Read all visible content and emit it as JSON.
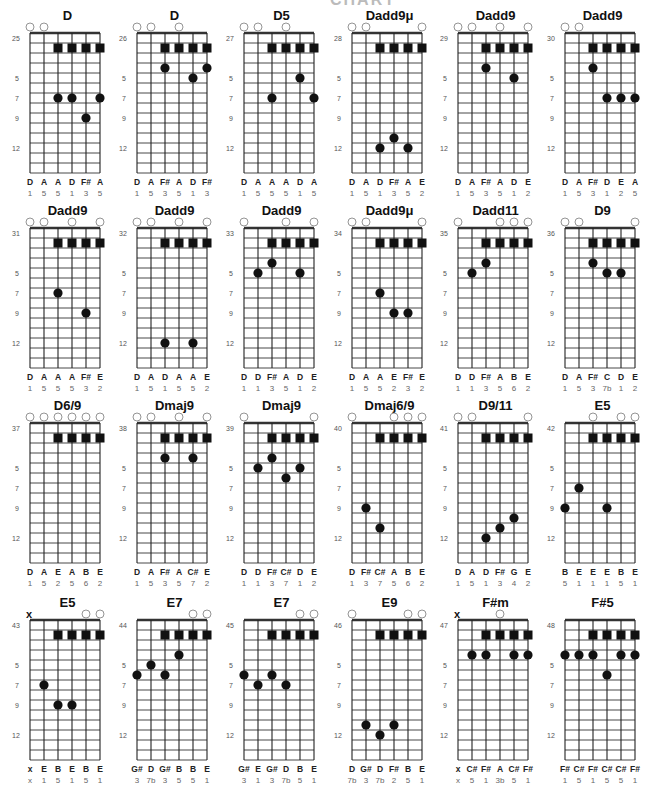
{
  "page": {
    "header_partial": "CHART"
  },
  "colors": {
    "ink": "#111111",
    "grid": "#222222",
    "open_circle": "#888888",
    "label_gray": "#555555"
  },
  "legend": {
    "fret_markers": [
      "5",
      "7",
      "9",
      "12"
    ],
    "open_string_symbol": "circle",
    "muted_string_symbol": "x",
    "root_marker": "square"
  },
  "charts": [
    {
      "id": "25",
      "title": "D",
      "top": [
        "o",
        "o",
        "",
        "",
        "",
        ""
      ],
      "squares": [
        2,
        3,
        4,
        5
      ],
      "dots": [
        [
          2,
          7
        ],
        [
          3,
          7
        ],
        [
          5,
          7
        ],
        [
          4,
          9
        ]
      ],
      "notes": [
        "D",
        "A",
        "A",
        "D",
        "F#",
        "A"
      ],
      "degrees": [
        "1",
        "5",
        "5",
        "1",
        "3",
        "5"
      ]
    },
    {
      "id": "26",
      "title": "D",
      "top": [
        "o",
        "o",
        "",
        "o",
        "",
        ""
      ],
      "squares": [
        2,
        3,
        4,
        5
      ],
      "dots": [
        [
          2,
          4
        ],
        [
          5,
          4
        ],
        [
          4,
          5
        ]
      ],
      "notes": [
        "D",
        "A",
        "F#",
        "A",
        "D",
        "F#"
      ],
      "degrees": [
        "1",
        "5",
        "3",
        "5",
        "1",
        "3"
      ]
    },
    {
      "id": "27",
      "title": "D5",
      "top": [
        "o",
        "o",
        "",
        "o",
        "",
        ""
      ],
      "squares": [
        2,
        3,
        4,
        5
      ],
      "dots": [
        [
          4,
          5
        ],
        [
          2,
          7
        ],
        [
          5,
          7
        ]
      ],
      "notes": [
        "D",
        "A",
        "A",
        "A",
        "D",
        "A"
      ],
      "degrees": [
        "1",
        "5",
        "5",
        "5",
        "1",
        "5"
      ]
    },
    {
      "id": "28",
      "title": "Dadd9μ",
      "top": [
        "o",
        "o",
        "",
        "",
        "",
        "o"
      ],
      "squares": [
        2,
        3,
        4,
        5
      ],
      "dots": [
        [
          3,
          11
        ],
        [
          2,
          12
        ],
        [
          4,
          12
        ]
      ],
      "notes": [
        "D",
        "A",
        "D",
        "F#",
        "A",
        "E"
      ],
      "degrees": [
        "1",
        "5",
        "1",
        "3",
        "5",
        "2"
      ]
    },
    {
      "id": "29",
      "title": "Dadd9",
      "top": [
        "o",
        "o",
        "",
        "o",
        "",
        "o"
      ],
      "squares": [
        2,
        3,
        4,
        5
      ],
      "dots": [
        [
          2,
          4
        ],
        [
          4,
          5
        ]
      ],
      "notes": [
        "D",
        "A",
        "F#",
        "A",
        "D",
        "E"
      ],
      "degrees": [
        "1",
        "5",
        "3",
        "5",
        "1",
        "2"
      ]
    },
    {
      "id": "30",
      "title": "Dadd9",
      "top": [
        "o",
        "o",
        "",
        "",
        "",
        ""
      ],
      "squares": [
        2,
        3,
        4,
        5
      ],
      "dots": [
        [
          2,
          4
        ],
        [
          3,
          7
        ],
        [
          4,
          7
        ],
        [
          5,
          7
        ]
      ],
      "notes": [
        "D",
        "A",
        "F#",
        "D",
        "E",
        "A"
      ],
      "degrees": [
        "1",
        "5",
        "3",
        "1",
        "2",
        "5"
      ]
    },
    {
      "id": "31",
      "title": "Dadd9",
      "top": [
        "o",
        "o",
        "",
        "o",
        "",
        "o"
      ],
      "squares": [
        2,
        3,
        4,
        5
      ],
      "dots": [
        [
          2,
          7
        ],
        [
          4,
          9
        ]
      ],
      "notes": [
        "D",
        "A",
        "A",
        "A",
        "F#",
        "E"
      ],
      "degrees": [
        "1",
        "5",
        "5",
        "5",
        "3",
        "2"
      ]
    },
    {
      "id": "32",
      "title": "Dadd9",
      "top": [
        "o",
        "o",
        "",
        "o",
        "",
        "o"
      ],
      "squares": [
        2,
        3,
        4,
        5
      ],
      "dots": [
        [
          2,
          12
        ],
        [
          4,
          12
        ]
      ],
      "notes": [
        "D",
        "A",
        "D",
        "A",
        "A",
        "E"
      ],
      "degrees": [
        "1",
        "5",
        "1",
        "5",
        "5",
        "2"
      ]
    },
    {
      "id": "33",
      "title": "Dadd9",
      "top": [
        "o",
        "",
        "",
        "o",
        "",
        "o"
      ],
      "squares": [
        2,
        3,
        4,
        5
      ],
      "dots": [
        [
          2,
          4
        ],
        [
          1,
          5
        ],
        [
          4,
          5
        ]
      ],
      "notes": [
        "D",
        "D",
        "F#",
        "A",
        "D",
        "E"
      ],
      "degrees": [
        "1",
        "1",
        "3",
        "5",
        "1",
        "2"
      ]
    },
    {
      "id": "34",
      "title": "Dadd9μ",
      "top": [
        "o",
        "o",
        "",
        "",
        "",
        "o"
      ],
      "squares": [
        2,
        3,
        4,
        5
      ],
      "dots": [
        [
          2,
          7
        ],
        [
          3,
          9
        ],
        [
          4,
          9
        ]
      ],
      "notes": [
        "D",
        "A",
        "A",
        "E",
        "F#",
        "E"
      ],
      "degrees": [
        "1",
        "5",
        "5",
        "2",
        "3",
        "2"
      ]
    },
    {
      "id": "35",
      "title": "Dadd11",
      "top": [
        "o",
        "",
        "",
        "o",
        "o",
        "o"
      ],
      "squares": [
        2,
        3,
        4,
        5
      ],
      "dots": [
        [
          2,
          4
        ],
        [
          1,
          5
        ]
      ],
      "notes": [
        "D",
        "D",
        "F#",
        "A",
        "B",
        "E"
      ],
      "degrees": [
        "1",
        "1",
        "3",
        "5",
        "6",
        "2"
      ]
    },
    {
      "id": "36",
      "title": "D9",
      "top": [
        "o",
        "o",
        "",
        "",
        "",
        "o"
      ],
      "squares": [
        2,
        3,
        4,
        5
      ],
      "dots": [
        [
          2,
          4
        ],
        [
          3,
          5
        ],
        [
          4,
          5
        ]
      ],
      "notes": [
        "D",
        "A",
        "F#",
        "C",
        "D",
        "E"
      ],
      "degrees": [
        "1",
        "5",
        "3",
        "7b",
        "1",
        "2"
      ]
    },
    {
      "id": "37",
      "title": "D6/9",
      "top": [
        "o",
        "o",
        "o",
        "o",
        "o",
        "o"
      ],
      "squares": [
        2,
        3,
        4,
        5
      ],
      "dots": [],
      "notes": [
        "D",
        "A",
        "E",
        "A",
        "B",
        "E"
      ],
      "degrees": [
        "1",
        "5",
        "2",
        "5",
        "6",
        "2"
      ]
    },
    {
      "id": "38",
      "title": "Dmaj9",
      "top": [
        "o",
        "o",
        "",
        "o",
        "",
        "o"
      ],
      "squares": [
        2,
        3,
        4,
        5
      ],
      "dots": [
        [
          2,
          4
        ],
        [
          4,
          4
        ]
      ],
      "notes": [
        "D",
        "A",
        "F#",
        "A",
        "C#",
        "E"
      ],
      "degrees": [
        "1",
        "5",
        "3",
        "5",
        "7",
        "2"
      ]
    },
    {
      "id": "39",
      "title": "Dmaj9",
      "top": [
        "o",
        "",
        "",
        "",
        "",
        "o"
      ],
      "squares": [
        2,
        3,
        4,
        5
      ],
      "dots": [
        [
          2,
          4
        ],
        [
          1,
          5
        ],
        [
          4,
          5
        ],
        [
          3,
          6
        ]
      ],
      "notes": [
        "D",
        "D",
        "F#",
        "C#",
        "D",
        "E"
      ],
      "degrees": [
        "1",
        "1",
        "3",
        "7",
        "1",
        "2"
      ]
    },
    {
      "id": "40",
      "title": "Dmaj6/9",
      "top": [
        "o",
        "",
        "",
        "o",
        "o",
        "o"
      ],
      "squares": [
        2,
        3,
        4,
        5
      ],
      "dots": [
        [
          1,
          9
        ],
        [
          2,
          11
        ]
      ],
      "notes": [
        "D",
        "F#",
        "C#",
        "A",
        "B",
        "E"
      ],
      "degrees": [
        "1",
        "3",
        "7",
        "5",
        "6",
        "2"
      ]
    },
    {
      "id": "41",
      "title": "D9/11",
      "top": [
        "o",
        "o",
        "",
        "",
        "",
        "o"
      ],
      "squares": [
        2,
        3,
        4,
        5
      ],
      "dots": [
        [
          4,
          10
        ],
        [
          3,
          11
        ],
        [
          2,
          12
        ]
      ],
      "notes": [
        "D",
        "A",
        "D",
        "F#",
        "G",
        "E"
      ],
      "degrees": [
        "1",
        "5",
        "1",
        "3",
        "4",
        "2"
      ]
    },
    {
      "id": "42",
      "title": "E5",
      "top": [
        "",
        "",
        "o",
        "",
        "o",
        "o"
      ],
      "squares": [
        2,
        3,
        4,
        5
      ],
      "dots": [
        [
          1,
          7
        ],
        [
          0,
          9
        ],
        [
          3,
          9
        ]
      ],
      "notes": [
        "B",
        "E",
        "E",
        "E",
        "B",
        "E"
      ],
      "degrees": [
        "5",
        "1",
        "1",
        "1",
        "5",
        "1"
      ]
    },
    {
      "id": "43",
      "title": "E5",
      "top": [
        "x",
        "",
        "",
        "",
        "o",
        "o"
      ],
      "squares": [
        2,
        3,
        4,
        5
      ],
      "dots": [
        [
          1,
          7
        ],
        [
          2,
          9
        ],
        [
          3,
          9
        ]
      ],
      "notes": [
        "x",
        "E",
        "B",
        "E",
        "B",
        "E"
      ],
      "degrees": [
        "x",
        "1",
        "5",
        "1",
        "5",
        "1"
      ]
    },
    {
      "id": "44",
      "title": "E7",
      "top": [
        "",
        "",
        "",
        "",
        "o",
        "o"
      ],
      "squares": [
        2,
        3,
        4,
        5
      ],
      "dots": [
        [
          3,
          4
        ],
        [
          1,
          5
        ],
        [
          0,
          6
        ],
        [
          2,
          6
        ]
      ],
      "notes": [
        "G#",
        "D",
        "G#",
        "B",
        "B",
        "E"
      ],
      "degrees": [
        "3",
        "7b",
        "3",
        "5",
        "5",
        "1"
      ]
    },
    {
      "id": "45",
      "title": "E7",
      "top": [
        "",
        "",
        "",
        "",
        "o",
        "o"
      ],
      "squares": [
        2,
        3,
        4,
        5
      ],
      "dots": [
        [
          0,
          6
        ],
        [
          2,
          6
        ],
        [
          1,
          7
        ],
        [
          3,
          7
        ]
      ],
      "notes": [
        "G#",
        "E",
        "G#",
        "D",
        "B",
        "E"
      ],
      "degrees": [
        "3",
        "1",
        "3",
        "7b",
        "5",
        "1"
      ]
    },
    {
      "id": "46",
      "title": "E9",
      "top": [
        "o",
        "",
        "",
        "",
        "o",
        "o"
      ],
      "squares": [
        2,
        3,
        4,
        5
      ],
      "dots": [
        [
          1,
          11
        ],
        [
          3,
          11
        ],
        [
          2,
          12
        ]
      ],
      "notes": [
        "D",
        "G#",
        "D",
        "F#",
        "B",
        "E"
      ],
      "degrees": [
        "7b",
        "3",
        "7b",
        "2",
        "5",
        "1"
      ]
    },
    {
      "id": "47",
      "title": "F#m",
      "top": [
        "x",
        "",
        "",
        "o",
        "",
        ""
      ],
      "squares": [
        2,
        3,
        4,
        5
      ],
      "dots": [
        [
          1,
          4
        ],
        [
          2,
          4
        ],
        [
          4,
          4
        ],
        [
          5,
          4
        ]
      ],
      "notes": [
        "x",
        "C#",
        "F#",
        "A",
        "C#",
        "F#"
      ],
      "degrees": [
        "x",
        "5",
        "1",
        "3b",
        "5",
        "1"
      ]
    },
    {
      "id": "48",
      "title": "F#5",
      "top": [
        "",
        "",
        "",
        "",
        "",
        ""
      ],
      "squares": [
        2,
        3,
        4,
        5
      ],
      "dots": [
        [
          0,
          4
        ],
        [
          1,
          4
        ],
        [
          2,
          4
        ],
        [
          4,
          4
        ],
        [
          5,
          4
        ],
        [
          3,
          6
        ]
      ],
      "notes": [
        "F#",
        "C#",
        "F#",
        "C#",
        "C#",
        "F#"
      ],
      "degrees": [
        "1",
        "5",
        "1",
        "5",
        "5",
        "1"
      ]
    }
  ]
}
